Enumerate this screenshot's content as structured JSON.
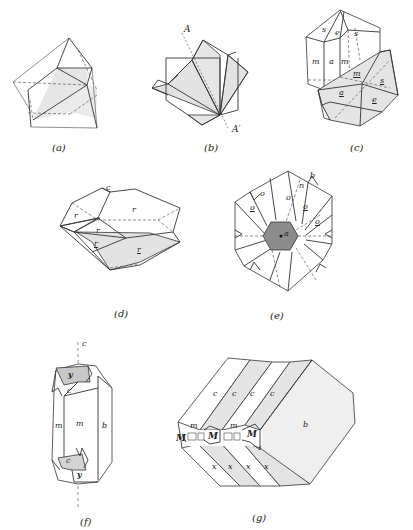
{
  "figure": {
    "panels": [
      {
        "id": "a",
        "caption": "(a)",
        "labels": []
      },
      {
        "id": "b",
        "caption": "(b)",
        "labels": [
          {
            "text": "A"
          },
          {
            "text": "A′"
          }
        ]
      },
      {
        "id": "c",
        "caption": "(c)",
        "labels": [
          {
            "text": "s",
            "underline": false
          },
          {
            "text": "e",
            "underline": false
          },
          {
            "text": "s",
            "underline": false
          },
          {
            "text": "m",
            "underline": false
          },
          {
            "text": "a",
            "underline": false
          },
          {
            "text": "m",
            "underline": false
          },
          {
            "text": "m",
            "underline": true
          },
          {
            "text": "s",
            "underline": true
          },
          {
            "text": "a",
            "underline": true
          },
          {
            "text": "e",
            "underline": true
          }
        ]
      },
      {
        "id": "d",
        "caption": "(d)",
        "labels": [
          {
            "text": "c",
            "underline": false
          },
          {
            "text": "r",
            "underline": false
          },
          {
            "text": "r",
            "underline": false
          },
          {
            "text": "r",
            "underline": false
          },
          {
            "text": "r",
            "underline": true
          },
          {
            "text": "r",
            "underline": true
          }
        ]
      },
      {
        "id": "e",
        "caption": "(e)",
        "labels": [
          {
            "text": "o",
            "underline": false
          },
          {
            "text": "o",
            "underline": false
          },
          {
            "text": "n",
            "underline": false
          },
          {
            "text": "b",
            "underline": false
          },
          {
            "text": "o",
            "underline": true
          },
          {
            "text": "o",
            "underline": true
          },
          {
            "text": "o",
            "underline": true
          },
          {
            "text": "a",
            "underline": false
          }
        ]
      },
      {
        "id": "f",
        "caption": "(f)",
        "labels": [
          {
            "text": "c"
          },
          {
            "text": "y"
          },
          {
            "text": "c"
          },
          {
            "text": "m"
          },
          {
            "text": "m"
          },
          {
            "text": "b"
          },
          {
            "text": "c"
          },
          {
            "text": "y"
          }
        ]
      },
      {
        "id": "g",
        "caption": "(g)",
        "labels": [
          {
            "text": "c"
          },
          {
            "text": "c"
          },
          {
            "text": "c"
          },
          {
            "text": "c"
          },
          {
            "text": "m"
          },
          {
            "text": "m"
          },
          {
            "text": "M"
          },
          {
            "text": "M"
          },
          {
            "text": "M"
          },
          {
            "text": "b"
          },
          {
            "text": "x"
          },
          {
            "text": "x"
          },
          {
            "text": "x"
          },
          {
            "text": "x"
          }
        ]
      }
    ]
  }
}
